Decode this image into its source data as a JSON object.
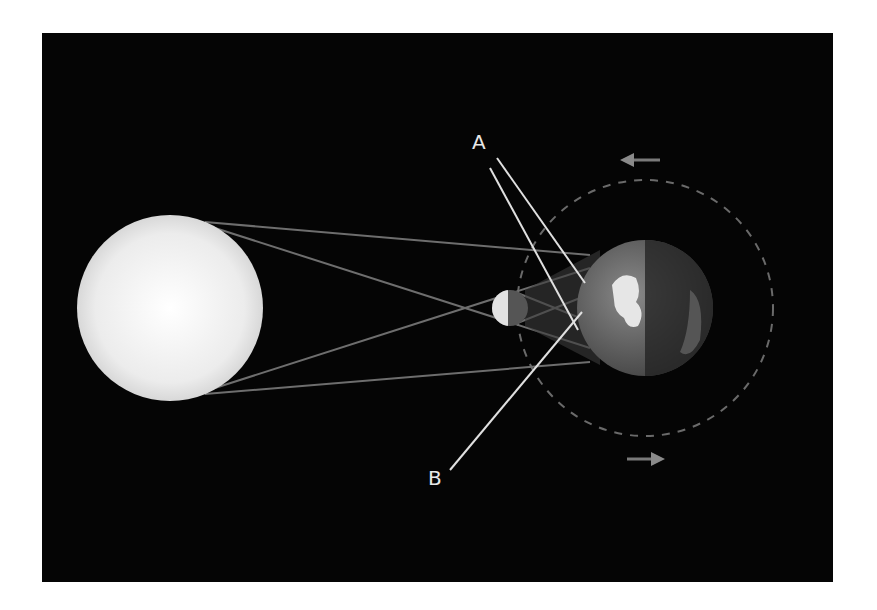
{
  "diagram": {
    "type": "solar eclipse geometry",
    "background_color": "#050505",
    "bodies": {
      "sun": {
        "name": "Sun",
        "cx": 170,
        "cy": 308,
        "r": 93,
        "color": "#f2f2f2"
      },
      "moon": {
        "name": "Moon",
        "cx": 510,
        "cy": 308,
        "r": 18
      },
      "earth": {
        "name": "Earth",
        "cx": 645,
        "cy": 308,
        "r": 68
      }
    },
    "orbit": {
      "cx": 645,
      "cy": 308,
      "r": 128,
      "style": "dashed"
    },
    "labels": {
      "a": {
        "text": "A",
        "x": 472,
        "y": 132
      },
      "b": {
        "text": "B",
        "x": 428,
        "y": 468
      }
    },
    "arrows": {
      "top": {
        "direction": "left",
        "x": 620,
        "y": 160
      },
      "bottom": {
        "direction": "right",
        "x": 640,
        "y": 460
      }
    },
    "callouts": {
      "a_targets": [
        "umbra region on Earth",
        "penumbra region on Earth"
      ],
      "b_target": "penumbra region on Earth"
    }
  }
}
